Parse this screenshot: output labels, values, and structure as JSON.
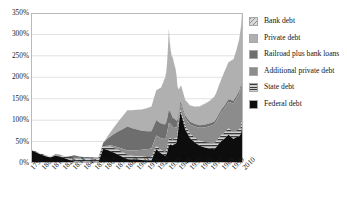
{
  "chart_data": {
    "type": "area",
    "stacked": true,
    "title": "",
    "xlabel": "",
    "ylabel": "",
    "ylim": [
      0,
      350
    ],
    "yunit": "%",
    "grid": true,
    "legend_position": "right",
    "ytick_labels": [
      "350%",
      "300%",
      "250%",
      "200%",
      "150%",
      "100%",
      "50%",
      "0%"
    ],
    "ytick_values": [
      350,
      300,
      250,
      200,
      150,
      100,
      50,
      0
    ],
    "xtick_labels": [
      "1790",
      "1801",
      "1812",
      "1823",
      "1834",
      "1845",
      "1856",
      "1867",
      "1878",
      "1889",
      "1900",
      "1911",
      "1922",
      "1933",
      "1944",
      "1955",
      "1966",
      "1977",
      "1988",
      "1999",
      "2010"
    ],
    "xtick_values": [
      1790,
      1801,
      1812,
      1823,
      1834,
      1845,
      1856,
      1867,
      1878,
      1889,
      1900,
      1911,
      1922,
      1933,
      1944,
      1955,
      1966,
      1977,
      1988,
      1999,
      2010
    ],
    "xlim": [
      1790,
      2010
    ],
    "x": [
      1790,
      1795,
      1800,
      1805,
      1810,
      1815,
      1820,
      1825,
      1830,
      1835,
      1840,
      1845,
      1850,
      1855,
      1860,
      1865,
      1870,
      1875,
      1880,
      1885,
      1890,
      1895,
      1900,
      1905,
      1910,
      1915,
      1920,
      1925,
      1929,
      1930,
      1931,
      1932,
      1933,
      1934,
      1935,
      1936,
      1937,
      1938,
      1939,
      1940,
      1941,
      1942,
      1943,
      1944,
      1945,
      1946,
      1950,
      1955,
      1960,
      1965,
      1970,
      1975,
      1980,
      1982,
      1985,
      1988,
      1990,
      1995,
      2000,
      2003,
      2006,
      2008,
      2009,
      2010
    ],
    "series": [
      {
        "name": "Federal debt",
        "color": "#0d0d0d",
        "pattern": "solid",
        "values": [
          30,
          25,
          20,
          16,
          13,
          17,
          15,
          11,
          7,
          3,
          1,
          1,
          2,
          2,
          2,
          33,
          30,
          25,
          20,
          14,
          9,
          8,
          8,
          7,
          6,
          6,
          32,
          22,
          17,
          18,
          22,
          30,
          40,
          42,
          43,
          42,
          41,
          43,
          44,
          45,
          47,
          60,
          80,
          100,
          118,
          112,
          78,
          58,
          48,
          40,
          36,
          34,
          32,
          36,
          45,
          52,
          55,
          66,
          56,
          60,
          62,
          68,
          84,
          95
        ]
      },
      {
        "name": "State debt",
        "color": "#4a4a4a",
        "pattern": "hstripe",
        "values": [
          2,
          2,
          2,
          2,
          2,
          3,
          4,
          5,
          7,
          9,
          11,
          12,
          11,
          9,
          8,
          9,
          10,
          11,
          11,
          11,
          10,
          9,
          8,
          8,
          8,
          8,
          8,
          8,
          9,
          10,
          12,
          14,
          16,
          15,
          14,
          14,
          13,
          13,
          13,
          12,
          11,
          9,
          8,
          7,
          6,
          7,
          9,
          10,
          11,
          12,
          13,
          14,
          14,
          14,
          14,
          14,
          14,
          15,
          15,
          16,
          16,
          17,
          18,
          19
        ]
      },
      {
        "name": "Additional private debt",
        "color": "#8c8c8c",
        "pattern": "solid",
        "values": [
          0,
          0,
          0,
          0,
          0,
          0,
          0,
          0,
          0,
          0,
          0,
          0,
          0,
          0,
          0,
          0,
          2,
          4,
          6,
          8,
          10,
          12,
          14,
          16,
          18,
          20,
          24,
          28,
          30,
          32,
          34,
          36,
          38,
          36,
          34,
          32,
          30,
          28,
          27,
          26,
          24,
          20,
          17,
          15,
          13,
          14,
          18,
          22,
          26,
          30,
          34,
          38,
          44,
          46,
          50,
          54,
          56,
          62,
          68,
          74,
          84,
          92,
          96,
          98
        ]
      },
      {
        "name": "Railroad plus bank loans",
        "color": "#6e6e6e",
        "pattern": "solid",
        "values": [
          0,
          0,
          0,
          0,
          0,
          0,
          0,
          0,
          2,
          6,
          3,
          1,
          1,
          2,
          3,
          5,
          16,
          26,
          36,
          46,
          56,
          52,
          48,
          44,
          42,
          40,
          36,
          34,
          34,
          33,
          32,
          31,
          30,
          28,
          26,
          24,
          22,
          20,
          19,
          18,
          16,
          12,
          9,
          7,
          6,
          6,
          6,
          6,
          6,
          6,
          6,
          6,
          6,
          6,
          6,
          6,
          6,
          6,
          6,
          6,
          6,
          6,
          6,
          6
        ]
      },
      {
        "name": "Private debt",
        "color": "#b0b0b0",
        "pattern": "solid",
        "values": [
          0,
          0,
          0,
          0,
          0,
          0,
          0,
          0,
          0,
          0,
          0,
          0,
          0,
          0,
          0,
          0,
          6,
          14,
          22,
          30,
          38,
          42,
          46,
          50,
          54,
          58,
          70,
          84,
          108,
          112,
          126,
          150,
          186,
          160,
          144,
          136,
          140,
          132,
          124,
          118,
          106,
          78,
          58,
          44,
          36,
          40,
          36,
          38,
          40,
          44,
          48,
          52,
          58,
          60,
          66,
          72,
          78,
          86,
          96,
          106,
          120,
          136,
          150,
          155
        ]
      },
      {
        "name": "Bank debt",
        "color": "#c8c8c8",
        "pattern": "diag",
        "values": [
          0,
          0,
          0,
          0,
          0,
          0,
          0,
          0,
          0,
          0,
          0,
          0,
          0,
          0,
          0,
          0,
          0,
          0,
          0,
          0,
          0,
          0,
          0,
          0,
          0,
          0,
          0,
          0,
          2,
          3,
          4,
          5,
          6,
          5,
          4,
          4,
          3,
          3,
          3,
          2,
          2,
          1,
          1,
          1,
          1,
          1,
          1,
          1,
          1,
          1,
          1,
          1,
          1,
          1,
          1,
          1,
          1,
          1,
          1,
          1,
          1,
          1,
          1,
          1
        ]
      }
    ]
  },
  "legend": {
    "items": [
      {
        "label": "Bank debt",
        "swatch": "bank-debt-swatch"
      },
      {
        "label": "Private debt",
        "swatch": "private-debt-swatch"
      },
      {
        "label": "Railroad plus bank loans",
        "swatch": "railroad-bank-loans-swatch"
      },
      {
        "label": "Additional private debt",
        "swatch": "additional-private-debt-swatch"
      },
      {
        "label": "State debt",
        "swatch": "state-debt-swatch"
      },
      {
        "label": "Federal debt",
        "swatch": "federal-debt-swatch"
      }
    ]
  }
}
